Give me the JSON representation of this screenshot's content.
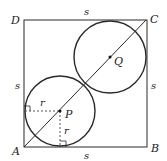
{
  "diagram": {
    "colors": {
      "stroke": "#2a2a2a",
      "background": "#ffffff"
    },
    "vertices": {
      "A": {
        "label": "A",
        "x": 24,
        "y": 147
      },
      "B": {
        "label": "B",
        "x": 147,
        "y": 147
      },
      "C": {
        "label": "C",
        "x": 146,
        "y": 20
      },
      "D": {
        "label": "D",
        "x": 24,
        "y": 20
      }
    },
    "side_labels": {
      "top": "s",
      "left": "s",
      "right": "s",
      "bottom": "s"
    },
    "circles": [
      {
        "center_label": "P",
        "cx": 60,
        "cy": 111,
        "r": 35
      },
      {
        "center_label": "Q",
        "cx": 110,
        "cy": 57,
        "r": 36
      }
    ],
    "radius_labels": {
      "horizontal": "r",
      "vertical": "r"
    },
    "diagonal": {
      "from": "A",
      "to": "C"
    }
  }
}
